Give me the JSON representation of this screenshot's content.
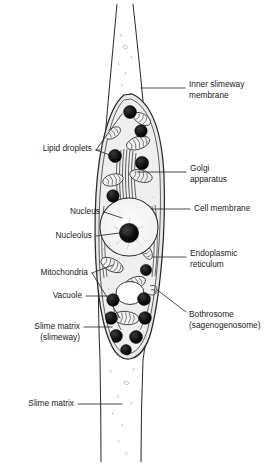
{
  "figure": {
    "background_color": "#ffffff",
    "ink_color": "#1a1a1a",
    "cytoplasm_fill": "#ebebeb",
    "nucleus_fill": "#f7f7f7",
    "organelle_dark": "#111111",
    "vacuole_fill": "#ffffff"
  },
  "labels": {
    "inner_slimeway_membrane": {
      "line1": "Inner slimeway",
      "line2": "membrane",
      "side": "right"
    },
    "lipid_droplets": {
      "line1": "Lipid droplets",
      "line2": "",
      "side": "left"
    },
    "golgi_apparatus": {
      "line1": "Golgi",
      "line2": "apparatus",
      "side": "right"
    },
    "nucleus": {
      "line1": "Nucleus",
      "line2": "",
      "side": "left"
    },
    "cell_membrane": {
      "line1": "Cell membrane",
      "line2": "",
      "side": "right"
    },
    "nucleolus": {
      "line1": "Nucleolus",
      "line2": "",
      "side": "left"
    },
    "endoplasmic_reticulum": {
      "line1": "Endoplasmic",
      "line2": "reticulum",
      "side": "right"
    },
    "mitochondria": {
      "line1": "Mitochondria",
      "line2": "",
      "side": "left"
    },
    "vacuole": {
      "line1": "Vacuole",
      "line2": "",
      "side": "left"
    },
    "bothrosome": {
      "line1": "Bothrosome",
      "line2": "(sagenogenosome)",
      "side": "right"
    },
    "slime_matrix_slimeway": {
      "line1": "Slime matrix",
      "line2": "(slimeway)",
      "side": "left"
    },
    "slime_matrix": {
      "line1": "Slime matrix",
      "line2": "",
      "side": "left"
    }
  },
  "structures": {
    "slime_tube": "tapered tube running full height, widest at the cell body",
    "cell_body": "spindle / ellipsoid cell occupying the middle of the tube",
    "lipid_droplet_count": 14,
    "mitochondria_count": 9,
    "golgi_stack_lamellae": 7,
    "vacuole_count": 1,
    "nucleolus_count": 1
  }
}
